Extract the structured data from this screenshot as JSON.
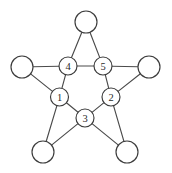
{
  "figure": {
    "type": "graph-diagram",
    "background_color": "#ffffff",
    "edge_color": "#4a4a4a",
    "node_fill": "#ffffff",
    "node_stroke": "#3c3c3c",
    "label_color": "#2a2a2a",
    "canvas": {
      "width": 172,
      "height": 173
    }
  },
  "graph": {
    "inner_node_radius": 9,
    "outer_node_radius": 11,
    "nodes": [
      {
        "id": "inner-1",
        "label": "1",
        "x": 59.5,
        "y": 97,
        "r": 9,
        "kind": "inner"
      },
      {
        "id": "inner-2",
        "label": "2",
        "x": 111,
        "y": 97,
        "r": 9,
        "kind": "inner"
      },
      {
        "id": "inner-3",
        "label": "3",
        "x": 85,
        "y": 118,
        "r": 9,
        "kind": "inner"
      },
      {
        "id": "inner-4",
        "label": "4",
        "x": 68,
        "y": 66,
        "r": 9,
        "kind": "inner"
      },
      {
        "id": "inner-5",
        "label": "5",
        "x": 103,
        "y": 66,
        "r": 9,
        "kind": "inner"
      },
      {
        "id": "outer-top",
        "label": "",
        "x": 86,
        "y": 22,
        "r": 11,
        "kind": "outer"
      },
      {
        "id": "outer-left",
        "label": "",
        "x": 22,
        "y": 67,
        "r": 11,
        "kind": "outer"
      },
      {
        "id": "outer-right",
        "label": "",
        "x": 149,
        "y": 67,
        "r": 11,
        "kind": "outer"
      },
      {
        "id": "outer-bottom-left",
        "label": "",
        "x": 43,
        "y": 152,
        "r": 11,
        "kind": "outer"
      },
      {
        "id": "outer-bottom-right",
        "label": "",
        "x": 127,
        "y": 152,
        "r": 11,
        "kind": "outer"
      }
    ],
    "edges": [
      {
        "from": "inner-4",
        "to": "inner-5",
        "name": "edge-4-5"
      },
      {
        "from": "inner-4",
        "to": "inner-1",
        "name": "edge-4-1"
      },
      {
        "from": "inner-1",
        "to": "inner-3",
        "name": "edge-1-3"
      },
      {
        "from": "inner-3",
        "to": "inner-2",
        "name": "edge-3-2"
      },
      {
        "from": "inner-2",
        "to": "inner-5",
        "name": "edge-2-5"
      },
      {
        "from": "outer-top",
        "to": "inner-4",
        "name": "edge-top-4"
      },
      {
        "from": "outer-top",
        "to": "inner-5",
        "name": "edge-top-5"
      },
      {
        "from": "outer-left",
        "to": "inner-4",
        "name": "edge-left-4"
      },
      {
        "from": "outer-left",
        "to": "inner-1",
        "name": "edge-left-1"
      },
      {
        "from": "outer-right",
        "to": "inner-5",
        "name": "edge-right-5"
      },
      {
        "from": "outer-right",
        "to": "inner-2",
        "name": "edge-right-2"
      },
      {
        "from": "outer-bottom-left",
        "to": "inner-1",
        "name": "edge-bottomleft-1"
      },
      {
        "from": "outer-bottom-left",
        "to": "inner-3",
        "name": "edge-bottomleft-3"
      },
      {
        "from": "outer-bottom-right",
        "to": "inner-2",
        "name": "edge-bottomright-2"
      },
      {
        "from": "outer-bottom-right",
        "to": "inner-3",
        "name": "edge-bottomright-3"
      }
    ]
  }
}
